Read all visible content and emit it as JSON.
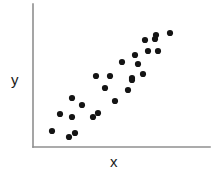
{
  "chart_data": {
    "type": "scatter",
    "title": "",
    "subtitle": "",
    "xlabel": "x",
    "ylabel": "y",
    "legend": [],
    "legend_position": "none",
    "grid": false,
    "xlim": [
      0,
      100
    ],
    "ylim": [
      0,
      100
    ],
    "xticks": [],
    "yticks": [],
    "annotations": [],
    "series": [
      {
        "name": "observations",
        "color": "#141414",
        "marker": "circle",
        "point_count": 26,
        "points": [
          {
            "px": 52,
            "py": 131
          },
          {
            "px": 69,
            "py": 137
          },
          {
            "px": 60,
            "py": 114
          },
          {
            "px": 75,
            "py": 133
          },
          {
            "px": 72,
            "py": 117
          },
          {
            "px": 82,
            "py": 105
          },
          {
            "px": 72,
            "py": 98
          },
          {
            "px": 93,
            "py": 117
          },
          {
            "px": 98,
            "py": 113
          },
          {
            "px": 96,
            "py": 76
          },
          {
            "px": 110,
            "py": 76
          },
          {
            "px": 105,
            "py": 88
          },
          {
            "px": 115,
            "py": 101
          },
          {
            "px": 122,
            "py": 62
          },
          {
            "px": 128,
            "py": 90
          },
          {
            "px": 132,
            "py": 78
          },
          {
            "px": 132,
            "py": 80
          },
          {
            "px": 135,
            "py": 55
          },
          {
            "px": 138,
            "py": 64
          },
          {
            "px": 143,
            "py": 74
          },
          {
            "px": 145,
            "py": 40
          },
          {
            "px": 148,
            "py": 51
          },
          {
            "px": 155,
            "py": 39
          },
          {
            "px": 158,
            "py": 51
          },
          {
            "px": 156,
            "py": 35
          },
          {
            "px": 170,
            "py": 33
          }
        ]
      }
    ],
    "axes": {
      "origin": {
        "px": 33,
        "py": 147
      },
      "y_axis_top": {
        "px": 33,
        "py": 4
      },
      "x_axis_right": {
        "px": 210,
        "py": 147
      },
      "axis_color": "#8f8f8f"
    },
    "marker_radius": 3.1
  },
  "labels": {
    "y": "y",
    "x": "x"
  }
}
